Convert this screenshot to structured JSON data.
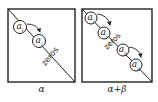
{
  "panels": [
    {
      "caption": "α",
      "nodes": [
        {
          "label": "a",
          "sub": "i"
        },
        {
          "label": "a",
          "sub": "j"
        }
      ],
      "zeros_text": "zeros"
    },
    {
      "caption": "α+β",
      "nodes": [
        {
          "label": "a",
          "sub": "i"
        },
        {
          "label": "a",
          "sub": "j"
        },
        {
          "label": "a",
          "sub": "p"
        },
        {
          "label": "a",
          "sub": "q"
        }
      ],
      "zeros_text": "zeros"
    }
  ],
  "colors": {
    "ink": "#222222",
    "background": "#ffffff"
  }
}
